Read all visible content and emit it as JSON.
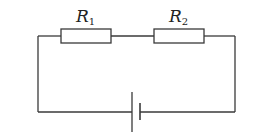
{
  "diagram": {
    "type": "series-circuit",
    "colors": {
      "wire": "#3a3a3a",
      "background": "#ffffff",
      "text": "#222222"
    },
    "components": [
      {
        "id": "R1",
        "kind": "resistor",
        "label": "R",
        "subscript": "1"
      },
      {
        "id": "R2",
        "kind": "resistor",
        "label": "R",
        "subscript": "2"
      },
      {
        "id": "battery",
        "kind": "cell"
      }
    ]
  }
}
